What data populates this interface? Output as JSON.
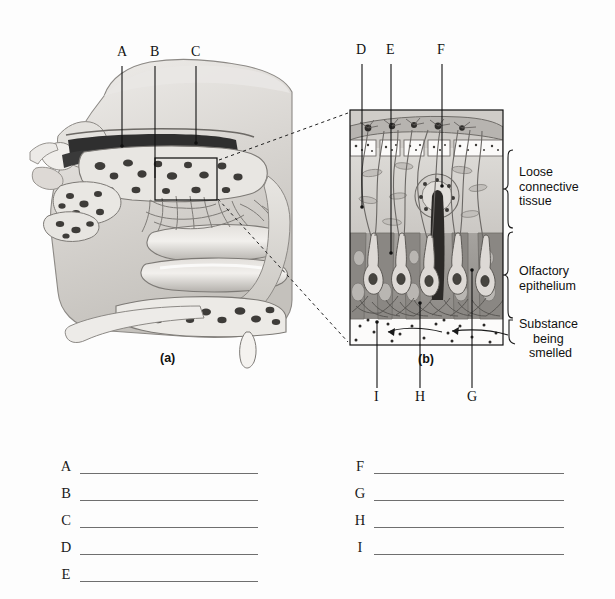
{
  "figure": {
    "panel_a_caption": "(a)",
    "panel_b_caption": "(b)",
    "leader_labels_top_left": [
      "A",
      "B",
      "C"
    ],
    "leader_labels_top_right": [
      "D",
      "E",
      "F"
    ],
    "leader_labels_bottom_right": [
      "I",
      "H",
      "G"
    ],
    "bracket_labels": [
      {
        "id": "loose-connective-tissue",
        "lines": [
          "Loose",
          "connective",
          "tissue"
        ]
      },
      {
        "id": "olfactory-epithelium",
        "lines": [
          "Olfactory",
          "epithelium"
        ]
      },
      {
        "id": "substance-being-smelled",
        "lines": [
          "Substance",
          "being",
          "smelled"
        ]
      }
    ]
  },
  "letters": {
    "A": "A",
    "B": "B",
    "C": "C",
    "D": "D",
    "E": "E",
    "F": "F",
    "G": "G",
    "H": "H",
    "I": "I"
  },
  "answer_blanks": {
    "left_column": [
      "A",
      "B",
      "C",
      "D",
      "E"
    ],
    "right_column": [
      "F",
      "G",
      "H",
      "I"
    ]
  },
  "colors": {
    "background": "#fdfdfd",
    "ink": "#1a1a1a",
    "line": "#6f6f6f",
    "tissue_light": "#d8d6d2",
    "tissue_mid": "#b9b6b1",
    "tissue_dark": "#8e8b87",
    "epithelium": "#9a9793",
    "bone_fill": "#e6e4e0",
    "cavity_dark": "#3a3a3a"
  }
}
